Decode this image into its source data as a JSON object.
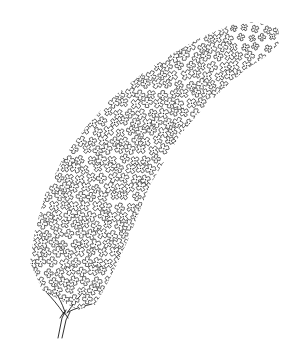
{
  "image": {
    "subject": "line drawing of a flower panicle",
    "description": "Curved conical cluster of many small four-petaled florets on a short branching stem",
    "colors": {
      "background": "#ffffff",
      "ink": "#1a1a1a"
    },
    "panicle": {
      "outline": [
        [
          30,
          262
        ],
        [
          35,
          230
        ],
        [
          45,
          195
        ],
        [
          62,
          160
        ],
        [
          85,
          128
        ],
        [
          110,
          100
        ],
        [
          140,
          75
        ],
        [
          170,
          55
        ],
        [
          200,
          38
        ],
        [
          230,
          25
        ],
        [
          255,
          22
        ],
        [
          278,
          28
        ],
        [
          280,
          42
        ],
        [
          268,
          55
        ],
        [
          245,
          70
        ],
        [
          222,
          90
        ],
        [
          200,
          112
        ],
        [
          180,
          135
        ],
        [
          165,
          160
        ],
        [
          150,
          185
        ],
        [
          140,
          210
        ],
        [
          130,
          235
        ],
        [
          118,
          262
        ],
        [
          105,
          288
        ],
        [
          95,
          305
        ],
        [
          78,
          310
        ],
        [
          60,
          300
        ],
        [
          42,
          290
        ]
      ],
      "floret_spacing": 11,
      "floret_radius": 5.6
    },
    "stem": {
      "paths": [
        "M58 338 L62 318 L66 310",
        "M62 338 L66 320 L70 312",
        "M64 314 C58 305 52 298 46 292",
        "M65 312 C62 303 58 296 55 290",
        "M68 312 C76 308 84 306 92 304",
        "M67 313 C72 306 76 300 80 296",
        "M60 318 L64 312 L68 318"
      ]
    }
  }
}
